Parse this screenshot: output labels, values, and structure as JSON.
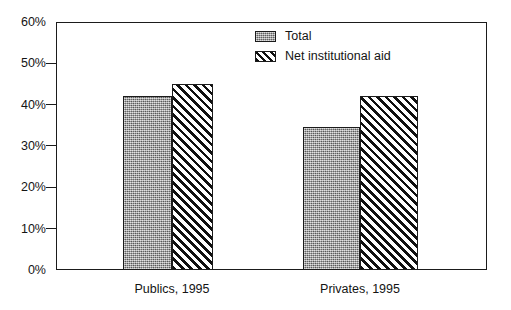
{
  "chart_data": {
    "type": "bar",
    "title": "",
    "subtitle": "",
    "xlabel": "",
    "ylabel": "",
    "categories": [
      "Publics, 1995",
      "Privates, 1995"
    ],
    "series": [
      {
        "name": "Total",
        "values": [
          42,
          34.5
        ],
        "pattern": "gray-stipple",
        "color": "#9b9b9b"
      },
      {
        "name": "Net institutional aid",
        "values": [
          45,
          42
        ],
        "pattern": "diagonal-hatch",
        "color": "#101010"
      }
    ],
    "ylim": [
      0,
      60
    ],
    "ytick_values": [
      0,
      10,
      20,
      30,
      40,
      50,
      60
    ],
    "ytick_labels": [
      "0%",
      "10%",
      "20%",
      "30%",
      "40%",
      "50%",
      "60%"
    ],
    "grid": false,
    "legend_position": "top-right",
    "value_format": "percent",
    "frame_color": "#1b1b1b",
    "background": "#ffffff"
  },
  "legend": {
    "items": [
      {
        "label": "Total",
        "swatch": "gray-stipple-swatch"
      },
      {
        "label": "Net institutional aid",
        "swatch": "diagonal-hatch-swatch"
      }
    ]
  },
  "axes": {
    "y": {
      "ticks": [
        {
          "label": "60%",
          "value": 60
        },
        {
          "label": "50%",
          "value": 50
        },
        {
          "label": "40%",
          "value": 40
        },
        {
          "label": "30%",
          "value": 30
        },
        {
          "label": "20%",
          "value": 20
        },
        {
          "label": "10%",
          "value": 10
        },
        {
          "label": "0%",
          "value": 0
        }
      ]
    },
    "x": {
      "ticks": [
        {
          "label": "Publics, 1995"
        },
        {
          "label": "Privates, 1995"
        }
      ]
    }
  }
}
